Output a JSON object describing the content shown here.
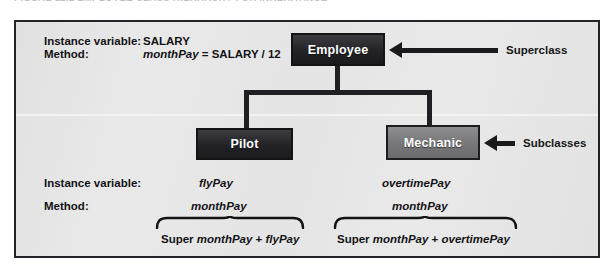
{
  "figure": {
    "caption": "FIGURE 11.1  EMPLOYEE CLASS HIERARCHY FOR INHERITANCE"
  },
  "colors": {
    "panel_background": "#e9e9e9",
    "panel_border": "#23232a",
    "superclass_box": "#232327",
    "pilot_box": "#232327",
    "mechanic_box": "#777779",
    "box_text": "#ffffff",
    "connector": "#202024",
    "text": "#131316"
  },
  "classes": {
    "superclass": {
      "name": "Employee",
      "instance_variable": "SALARY",
      "method": "monthPay",
      "method_expression": " = SALARY / 12"
    },
    "subclass_left": {
      "name": "Pilot",
      "instance_variable": "flyPay",
      "method": "monthPay"
    },
    "subclass_right": {
      "name": "Mechanic",
      "instance_variable": "overtimePay",
      "method": "monthPay"
    }
  },
  "row_labels": {
    "instance_variable": "Instance variable:",
    "method": "Method:"
  },
  "annotations": {
    "superclass_arrow": "Superclass",
    "subclasses_arrow": "Subclasses"
  },
  "derived_methods": {
    "left": {
      "prefix": "Super ",
      "base": "monthPay",
      "operator": " + ",
      "addend": "flyPay"
    },
    "right": {
      "prefix": "Super ",
      "base": "monthPay",
      "operator": " + ",
      "addend": "overtimePay"
    }
  }
}
